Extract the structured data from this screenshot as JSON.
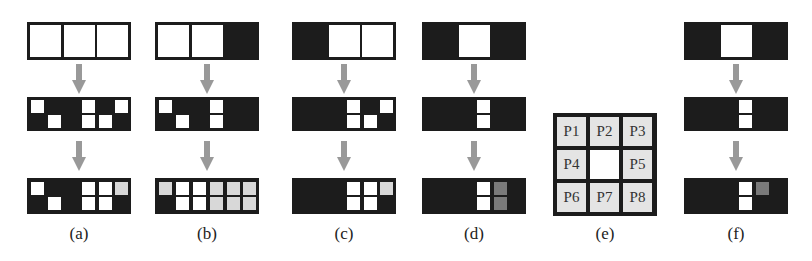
{
  "colors": {
    "black": "#1c1c1c",
    "white": "#ffffff",
    "light_gray": "#d8d8d8",
    "dark_gray": "#7a7a7a",
    "arrow": "#999999"
  },
  "panels": [
    {
      "id": "a",
      "label": "(a)",
      "left": 27,
      "top_slots": [
        "white",
        "white",
        "white"
      ],
      "mid_cells": {
        "top": [
          "w",
          "k",
          "k",
          "w",
          "k",
          "w"
        ],
        "bottom": [
          "k",
          "w",
          "k",
          "w",
          "w",
          "k"
        ]
      },
      "bot_cells": {
        "top": [
          "w",
          "k",
          "k",
          "w",
          "w",
          "g"
        ],
        "bottom": [
          "k",
          "w",
          "k",
          "w",
          "w",
          "k"
        ]
      }
    },
    {
      "id": "b",
      "label": "(b)",
      "left": 155,
      "top_slots": [
        "white",
        "white",
        "black"
      ],
      "mid_cells": {
        "top": [
          "w",
          "k",
          "k",
          "w",
          "k",
          "k"
        ],
        "bottom": [
          "k",
          "w",
          "k",
          "w",
          "k",
          "k"
        ]
      },
      "bot_cells": {
        "top": [
          "g",
          "w",
          "w",
          "g",
          "g",
          "g"
        ],
        "bottom": [
          "k",
          "w",
          "w",
          "g",
          "g",
          "g"
        ]
      }
    },
    {
      "id": "c",
      "label": "(c)",
      "left": 292,
      "top_slots": [
        "black",
        "white",
        "white"
      ],
      "mid_cells": {
        "top": [
          "k",
          "k",
          "k",
          "w",
          "k",
          "w"
        ],
        "bottom": [
          "k",
          "k",
          "k",
          "w",
          "w",
          "k"
        ]
      },
      "bot_cells": {
        "top": [
          "k",
          "k",
          "k",
          "w",
          "w",
          "g"
        ],
        "bottom": [
          "k",
          "k",
          "k",
          "w",
          "w",
          "k"
        ]
      }
    },
    {
      "id": "d",
      "label": "(d)",
      "left": 422,
      "top_slots": [
        "black",
        "white",
        "black"
      ],
      "mid_cells": {
        "top": [
          "k",
          "k",
          "k",
          "w",
          "k",
          "k"
        ],
        "bottom": [
          "k",
          "k",
          "k",
          "w",
          "k",
          "k"
        ]
      },
      "bot_cells": {
        "top": [
          "k",
          "k",
          "k",
          "w",
          "d",
          "k"
        ],
        "bottom": [
          "k",
          "k",
          "k",
          "w",
          "d",
          "k"
        ]
      }
    },
    {
      "id": "f",
      "label": "(f)",
      "left": 684,
      "top_slots": [
        "black",
        "white",
        "black"
      ],
      "mid_cells": {
        "top": [
          "k",
          "k",
          "k",
          "w",
          "k",
          "k"
        ],
        "bottom": [
          "k",
          "k",
          "k",
          "w",
          "k",
          "k"
        ]
      },
      "bot_cells": {
        "top": [
          "k",
          "k",
          "k",
          "w",
          "d",
          "k"
        ],
        "bottom": [
          "k",
          "k",
          "k",
          "w",
          "k",
          "k"
        ]
      }
    }
  ],
  "neighborhood": {
    "id": "e",
    "label": "(e)",
    "left": 553,
    "cells": [
      "P1",
      "P2",
      "P3",
      "P4",
      "",
      "P5",
      "P6",
      "P7",
      "P8"
    ]
  }
}
